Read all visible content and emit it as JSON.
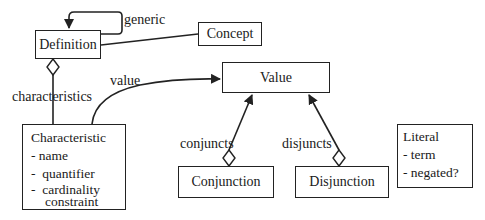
{
  "classes": {
    "definition": {
      "name": "Definition"
    },
    "concept": {
      "name": "Concept"
    },
    "value": {
      "name": "Value"
    },
    "characteristic": {
      "name": "Characteristic",
      "attributes": [
        "- name",
        "-  quantifier",
        "-  cardinality",
        "constraint"
      ]
    },
    "conjunction": {
      "name": "Conjunction"
    },
    "disjunction": {
      "name": "Disjunction"
    },
    "literal": {
      "name": "Literal",
      "attributes": [
        "- term",
        "- negated?"
      ]
    }
  },
  "relations": {
    "generic": "generic",
    "characteristics": "characteristics",
    "value": "value",
    "conjuncts": "conjuncts",
    "disjuncts": "disjuncts"
  }
}
